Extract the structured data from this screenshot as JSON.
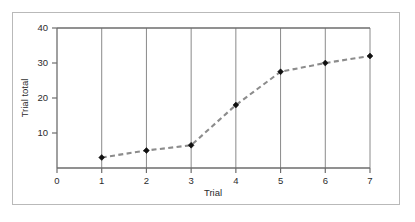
{
  "chart_data": {
    "type": "line",
    "title": "",
    "subtitle": "",
    "xlabel": "Trial",
    "ylabel": "Trial total",
    "x": [
      1,
      2,
      3,
      4,
      5,
      6,
      7
    ],
    "values": [
      3,
      5,
      6.5,
      18,
      27.5,
      30,
      32
    ],
    "series": [
      {
        "name": "Trial total",
        "x": [
          1,
          2,
          3,
          4,
          5,
          6,
          7
        ],
        "values": [
          3,
          5,
          6.5,
          18,
          27.5,
          30,
          32
        ]
      }
    ],
    "xlim": [
      0,
      7
    ],
    "ylim": [
      0,
      40
    ],
    "x_tick_labels": [
      "0",
      "1",
      "2",
      "3",
      "4",
      "5",
      "6",
      "7"
    ],
    "x_tick_values": [
      0,
      1,
      2,
      3,
      4,
      5,
      6,
      7
    ],
    "y_tick_labels": [
      "10",
      "20",
      "30",
      "40"
    ],
    "y_tick_values": [
      10,
      20,
      30,
      40
    ],
    "grid": "vertical",
    "legend": "none",
    "line_style": "dashed",
    "marker_style": "diamond",
    "colors": {
      "line": "#8c8c8c",
      "marker": "#111111",
      "axis": "#6d6d6d",
      "gridline": "#8a8a8a",
      "frame": "#b9b9b9",
      "background": "#ffffff",
      "text": "#2b2b2b"
    }
  },
  "axes": {
    "y_title": "Trial total",
    "x_title": "Trial",
    "y_ticks": [
      {
        "label": "40",
        "value": 40
      },
      {
        "label": "30",
        "value": 30
      },
      {
        "label": "20",
        "value": 20
      },
      {
        "label": "10",
        "value": 10
      }
    ],
    "x_ticks": [
      {
        "label": "0",
        "value": 0
      },
      {
        "label": "1",
        "value": 1
      },
      {
        "label": "2",
        "value": 2
      },
      {
        "label": "3",
        "value": 3
      },
      {
        "label": "4",
        "value": 4
      },
      {
        "label": "5",
        "value": 5
      },
      {
        "label": "6",
        "value": 6
      },
      {
        "label": "7",
        "value": 7
      }
    ]
  }
}
